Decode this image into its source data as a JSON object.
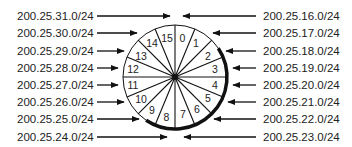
{
  "diagram": {
    "left_labels": [
      "200.25.31.0/24",
      "200.25.30.0/24",
      "200.25.29.0/24",
      "200.25.28.0/24",
      "200.25.27.0/24",
      "200.25.26.0/24",
      "200.25.25.0/24",
      "200.25.24.0/24"
    ],
    "right_labels": [
      "200.25.16.0/24",
      "200.25.17.0/24",
      "200.25.18.0/24",
      "200.25.19.0/24",
      "200.25.20.0/24",
      "200.25.21.0/24",
      "200.25.22.0/24",
      "200.25.23.0/24"
    ],
    "segments": [
      "0",
      "1",
      "2",
      "3",
      "4",
      "5",
      "6",
      "7",
      "8",
      "9",
      "10",
      "11",
      "12",
      "13",
      "14",
      "15"
    ],
    "colors": {
      "line": "#111111",
      "text": "#222222",
      "background": "#ffffff"
    }
  }
}
